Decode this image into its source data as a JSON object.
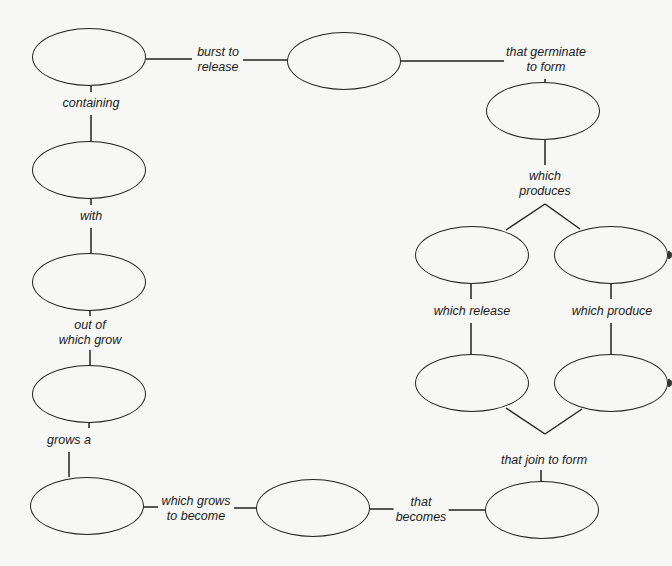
{
  "diagram": {
    "type": "concept-map",
    "colors": {
      "background": "#f7f7f5",
      "stroke": "#222222",
      "text": "#1a1a1a"
    },
    "nodes": [
      {
        "id": "n1",
        "text": "",
        "x": 32,
        "y": 28,
        "w": 114,
        "h": 58
      },
      {
        "id": "n2",
        "text": "",
        "x": 287,
        "y": 32,
        "w": 114,
        "h": 58
      },
      {
        "id": "n3",
        "text": "",
        "x": 486,
        "y": 82,
        "w": 114,
        "h": 58
      },
      {
        "id": "n4",
        "text": "",
        "x": 32,
        "y": 141,
        "w": 114,
        "h": 58
      },
      {
        "id": "n5",
        "text": "",
        "x": 32,
        "y": 253,
        "w": 114,
        "h": 58
      },
      {
        "id": "n6",
        "text": "",
        "x": 32,
        "y": 365,
        "w": 114,
        "h": 58
      },
      {
        "id": "n7",
        "text": "",
        "x": 415,
        "y": 226,
        "w": 114,
        "h": 58
      },
      {
        "id": "n8",
        "text": "",
        "x": 554,
        "y": 226,
        "w": 114,
        "h": 58
      },
      {
        "id": "n9",
        "text": "",
        "x": 415,
        "y": 354,
        "w": 114,
        "h": 58
      },
      {
        "id": "n10",
        "text": "",
        "x": 554,
        "y": 354,
        "w": 114,
        "h": 58
      },
      {
        "id": "n11",
        "text": "",
        "x": 30,
        "y": 477,
        "w": 114,
        "h": 58
      },
      {
        "id": "n12",
        "text": "",
        "x": 256,
        "y": 479,
        "w": 114,
        "h": 58
      },
      {
        "id": "n13",
        "text": "",
        "x": 485,
        "y": 481,
        "w": 114,
        "h": 58
      }
    ],
    "links": [
      {
        "id": "l1",
        "text": "burst to\nrelease",
        "x": 215,
        "y": 61
      },
      {
        "id": "l2",
        "text": "that germinate\nto form",
        "x": 550,
        "y": 59
      },
      {
        "id": "l3",
        "text": "containing",
        "x": 91,
        "y": 103
      },
      {
        "id": "l4",
        "text": "which\nproduces",
        "x": 545,
        "y": 178
      },
      {
        "id": "l5",
        "text": "with",
        "x": 91,
        "y": 216
      },
      {
        "id": "l6",
        "text": "which release",
        "x": 472,
        "y": 311
      },
      {
        "id": "l7",
        "text": "which produce",
        "x": 612,
        "y": 311
      },
      {
        "id": "l8",
        "text": "out of\nwhich grow",
        "x": 90,
        "y": 332
      },
      {
        "id": "l9",
        "text": "grows a",
        "x": 70,
        "y": 439
      },
      {
        "id": "l10",
        "text": "that join to form",
        "x": 545,
        "y": 460
      },
      {
        "id": "l11",
        "text": "which grows\nto become",
        "x": 196,
        "y": 509
      },
      {
        "id": "l12",
        "text": "that\nbecomes",
        "x": 422,
        "y": 510
      }
    ]
  }
}
